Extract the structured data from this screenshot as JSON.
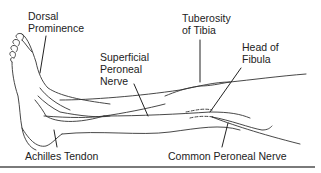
{
  "diagram": {
    "type": "anatomical-illustration",
    "colors": {
      "line": "#333333",
      "text": "#222222",
      "divider": "#7a7a7a",
      "background": "#ffffff"
    },
    "labels": {
      "dorsal_prominence": {
        "line1": "Dorsal",
        "line2": "Prominence"
      },
      "superficial_peroneal_nerve": {
        "line1": "Superficial",
        "line2": "Peroneal",
        "line3": "Nerve"
      },
      "tuberosity_of_tibia": {
        "line1": "Tuberosity",
        "line2": "of Tibia"
      },
      "head_of_fibula": {
        "line1": "Head of",
        "line2": "Fibula"
      },
      "achilles_tendon": {
        "text": "Achilles Tendon"
      },
      "common_peroneal_nerve": {
        "text": "Common Peroneal Nerve"
      }
    }
  }
}
